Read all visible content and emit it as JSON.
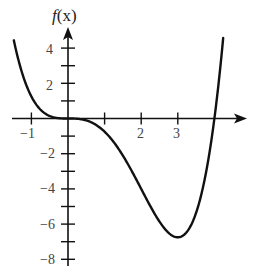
{
  "chart_data": {
    "type": "line",
    "title": "",
    "ylabel": "f(x)",
    "xlabel": "",
    "function_description": "f(x) = (x^4 - 4x^3)/4",
    "xlim": [
      -1.5,
      4.25
    ],
    "ylim": [
      -8,
      4.6
    ],
    "x_ticks": [
      -1,
      1,
      2,
      3
    ],
    "x_tick_labels": [
      "-1",
      "",
      "2",
      "3"
    ],
    "y_ticks": [
      -8,
      -7,
      -6,
      -5,
      -4,
      -3,
      -2,
      -1,
      1,
      2,
      3,
      4
    ],
    "y_tick_labels": {
      "-8": "−8",
      "-6": "−6",
      "-4": "−4",
      "-2": "−2",
      "2": "2",
      "4": "4"
    },
    "grid": false,
    "legend": null,
    "series": [
      {
        "name": "f(x)",
        "color": "#111111",
        "x": [
          -1.5,
          -1.25,
          -1.0,
          -0.75,
          -0.5,
          -0.25,
          0,
          0.25,
          0.5,
          0.75,
          1.0,
          1.25,
          1.5,
          1.75,
          2.0,
          2.25,
          2.5,
          2.75,
          3.0,
          3.25,
          3.5,
          3.75,
          4.0,
          4.1,
          4.2
        ],
        "y": [
          4.64,
          2.56,
          1.25,
          0.5,
          0.14,
          0.02,
          0,
          -0.02,
          -0.05,
          -0.13,
          -0.75,
          -1.34,
          -2.11,
          -3.01,
          -4.0,
          -4.99,
          -5.86,
          -6.48,
          -6.75,
          -6.5,
          -5.36,
          -3.3,
          0,
          1.13,
          2.33
        ]
      }
    ],
    "key_points": {
      "roots": [
        0,
        4
      ],
      "local_min": {
        "x": 3,
        "y": -6.75
      },
      "inflection_points": [
        0,
        2
      ]
    }
  },
  "labels": {
    "y_axis_title": "f",
    "y_axis_title_arg": "(x)",
    "x_tick_neg1": "−1",
    "x_tick_2": "2",
    "x_tick_3": "3",
    "y_tick_4": "4",
    "y_tick_2": "2",
    "y_tick_neg2": "−2",
    "y_tick_neg4": "−4",
    "y_tick_neg6": "−6",
    "y_tick_neg8": "−8"
  }
}
